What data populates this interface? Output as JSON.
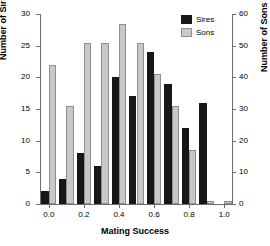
{
  "chart_data": {
    "type": "bar",
    "title": "",
    "xlabel": "Mating Success",
    "ylabel": "Number of Sires",
    "ylabel_right": "Number of Sons",
    "categories": [
      "0.0",
      "0.1",
      "0.2",
      "0.3",
      "0.4",
      "0.5",
      "0.6",
      "0.7",
      "0.8",
      "0.9",
      "1.0"
    ],
    "x": [
      0.0,
      0.1,
      0.2,
      0.3,
      0.4,
      0.5,
      0.6,
      0.7,
      0.8,
      0.9,
      1.0
    ],
    "series": [
      {
        "name": "Sires",
        "axis": "left",
        "color": "#171717",
        "values": [
          2,
          4,
          8,
          6,
          20,
          17,
          24,
          19,
          12,
          16,
          0
        ]
      },
      {
        "name": "Sons",
        "axis": "right",
        "color": "#c8c8c8",
        "values": [
          44,
          31,
          51,
          51,
          57,
          51,
          41,
          31,
          17,
          1,
          1
        ]
      }
    ],
    "ylim": [
      0,
      30
    ],
    "ylim_right": [
      0,
      60
    ],
    "xlim": [
      -0.05,
      1.05
    ],
    "yticks": [
      0,
      5,
      10,
      15,
      20,
      25,
      30
    ],
    "yticks_right": [
      0,
      10,
      20,
      30,
      40,
      50,
      60
    ],
    "xticks": [
      0.0,
      0.2,
      0.4,
      0.6,
      0.8,
      1.0
    ],
    "xticklabels": [
      "0.0",
      "0.2",
      "0.4",
      "0.6",
      "0.8",
      "1.0"
    ],
    "grid": false,
    "legend": [
      "Sires",
      "Sons"
    ],
    "legend_position": "top-right"
  },
  "legend": {
    "items": [
      {
        "label": "Sires",
        "swatch": "dark-swatch"
      },
      {
        "label": "Sons",
        "swatch": "light-swatch"
      }
    ]
  },
  "axes": {
    "left_title": "Number of Sires",
    "right_title": "Number of Sons",
    "bottom_title": "Mating Success"
  }
}
